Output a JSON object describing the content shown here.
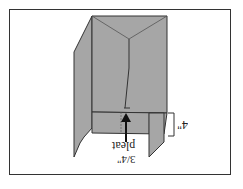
{
  "diagram": {
    "orientation": "rotated 180°",
    "labels": {
      "height": "4\"",
      "pleat_word": "pleat",
      "pleat_size": "3/4\""
    },
    "colors": {
      "panel": "#a6a6a6",
      "edge": "#333333",
      "background": "#ffffff"
    }
  }
}
